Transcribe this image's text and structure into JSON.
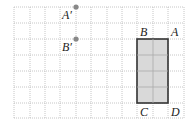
{
  "figure": {
    "grid": {
      "x_lines": [
        14,
        30,
        45,
        60,
        76,
        91,
        107,
        122,
        137,
        153,
        168,
        184
      ],
      "y_lines": [
        7,
        23,
        39,
        55,
        71,
        87,
        103,
        118
      ],
      "color": "#b8b8b8"
    },
    "rectangle": {
      "x": 137,
      "y": 39,
      "width": 31,
      "height": 64,
      "fill": "#d9d9d9",
      "stroke": "#333333"
    },
    "points": [
      {
        "name": "A_prime",
        "label": "A′",
        "x": 76,
        "y": 7,
        "label_x": 62,
        "label_y": 19
      },
      {
        "name": "B_prime",
        "label": "B′",
        "x": 76,
        "y": 39,
        "label_x": 62,
        "label_y": 51
      }
    ],
    "vertex_labels": [
      {
        "name": "B",
        "label": "B",
        "x": 140,
        "y": 36
      },
      {
        "name": "A",
        "label": "A",
        "x": 171,
        "y": 36
      },
      {
        "name": "C",
        "label": "C",
        "x": 140,
        "y": 116
      },
      {
        "name": "D",
        "label": "D",
        "x": 171,
        "y": 116
      }
    ],
    "point_color": "#888888"
  }
}
